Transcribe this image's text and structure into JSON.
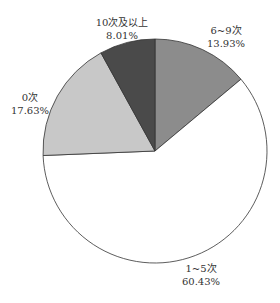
{
  "chart_data": {
    "type": "pie",
    "title": "",
    "categories": [
      "6~9次",
      "1~5次",
      "0次",
      "10次及以上"
    ],
    "values": [
      13.93,
      60.43,
      17.63,
      8.01
    ],
    "unit": "%",
    "start_angle": "12 o'clock, clockwise",
    "colors": [
      "#8c8c8c",
      "#ffffff",
      "#c8c8c8",
      "#4a4a4a"
    ],
    "labels": [
      {
        "name": "6~9次",
        "value": "13.93%"
      },
      {
        "name": "1~5次",
        "value": "60.43%"
      },
      {
        "name": "0次",
        "value": "17.63%"
      },
      {
        "name": "10次及以上",
        "value": "8.01%"
      }
    ],
    "legend": "none (labels placed outside slices)"
  }
}
